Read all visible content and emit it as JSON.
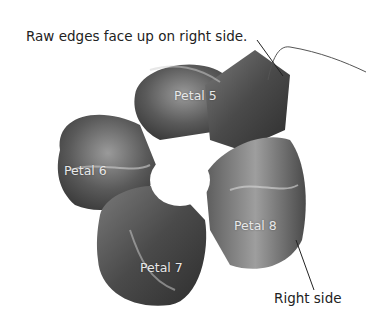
{
  "callouts": {
    "top": "Raw edges face up on right side.",
    "bottom": "Right side"
  },
  "petals": [
    {
      "label": "Petal 5"
    },
    {
      "label": "Petal 6"
    },
    {
      "label": "Petal 7"
    },
    {
      "label": "Petal 8"
    }
  ],
  "colors": {
    "fabric_dark": "#3c3c3c",
    "fabric_mid": "#6e6e6e",
    "fabric_light": "#b0b0b0",
    "leader_line": "#222222"
  }
}
